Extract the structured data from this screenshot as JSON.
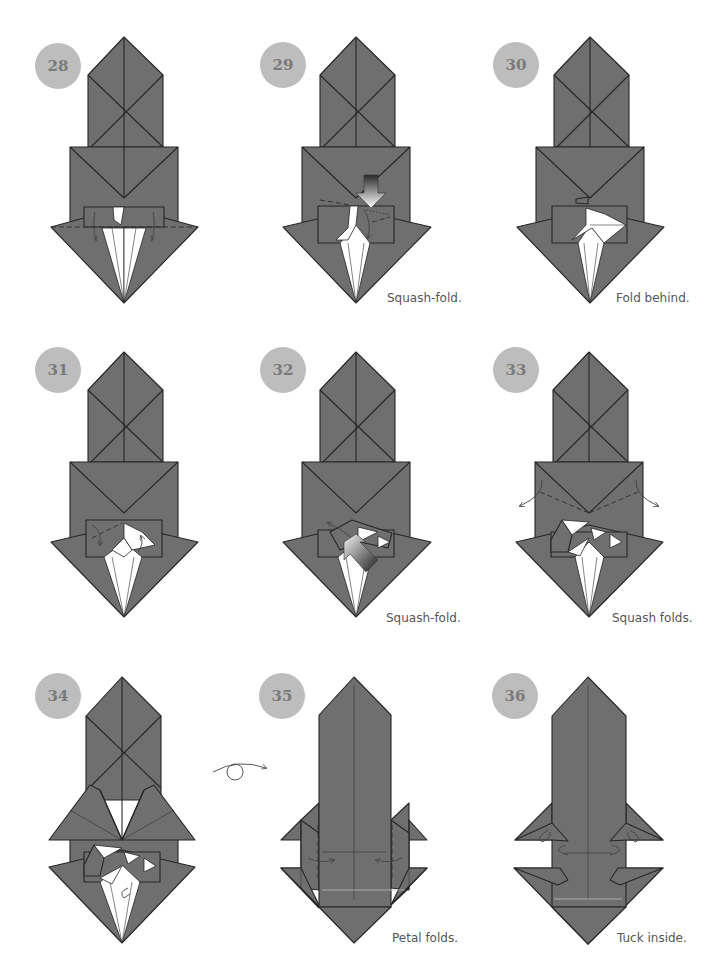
{
  "colors": {
    "paper": "#6f6f6f",
    "line": "#262626",
    "circle": "#bdbdbd",
    "circle_text": "#7a7a7a",
    "caption": "#555555",
    "background": "#ffffff"
  },
  "steps": [
    {
      "number": "28",
      "caption": "",
      "type": "base",
      "ox": 0,
      "oy": 0,
      "cx": 124,
      "circle": [
        58,
        66
      ]
    },
    {
      "number": "29",
      "caption": "Squash-fold.",
      "type": "base",
      "ox": 240,
      "oy": 0,
      "cx": 116,
      "circle": [
        43,
        65
      ]
    },
    {
      "number": "30",
      "caption": "Fold behind.",
      "type": "base",
      "ox": 480,
      "oy": 0,
      "cx": 110,
      "circle": [
        36,
        65
      ]
    },
    {
      "number": "31",
      "caption": "",
      "type": "base",
      "ox": 0,
      "oy": 320,
      "cx": 124,
      "circle": [
        58,
        50
      ]
    },
    {
      "number": "32",
      "caption": "Squash-fold.",
      "type": "base",
      "ox": 240,
      "oy": 320,
      "cx": 116,
      "circle": [
        43,
        50
      ]
    },
    {
      "number": "33",
      "caption": "Squash folds.",
      "type": "base",
      "ox": 480,
      "oy": 320,
      "cx": 110,
      "circle": [
        36,
        50
      ]
    },
    {
      "number": "34",
      "caption": "",
      "type": "hat",
      "ox": 0,
      "oy": 640,
      "cx": 122,
      "circle": [
        58,
        56
      ]
    },
    {
      "number": "35",
      "caption": "Petal folds.",
      "type": "tower",
      "ox": 210,
      "oy": 640,
      "cx": 144,
      "circle": [
        72,
        56
      ]
    },
    {
      "number": "36",
      "caption": "Tuck inside.",
      "type": "tower",
      "ox": 480,
      "oy": 640,
      "cx": 108,
      "circle": [
        35,
        56
      ]
    }
  ],
  "symbols": {
    "turn_over": "turn-over-arrow-icon"
  }
}
